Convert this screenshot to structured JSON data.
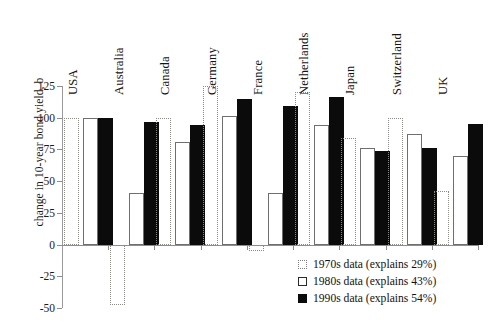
{
  "chart_data": {
    "type": "bar",
    "title": "",
    "xlabel": "",
    "ylabel": "change in 10-year bond yield, b",
    "ylim": [
      -50,
      125
    ],
    "yticks": [
      125,
      100,
      75,
      50,
      25,
      0,
      -25,
      -50
    ],
    "ytick_labels": [
      "125",
      "100",
      "75",
      "50",
      "25",
      "0",
      "-25",
      "-50"
    ],
    "grid": false,
    "legend_position": "bottom-right",
    "categories": [
      "USA",
      "Australia",
      "Canada",
      "Germany",
      "France",
      "Netherlands",
      "Japan",
      "Switzerland",
      "UK"
    ],
    "series": [
      {
        "name": "1970s data (explains 29%)",
        "short_name": "1970s data",
        "explains": "29%",
        "style": "dotted-outline",
        "values": [
          100,
          -48,
          100,
          125,
          -5,
          120,
          84,
          100,
          42
        ]
      },
      {
        "name": "1980s data (explains 43%)",
        "short_name": "1980s data",
        "explains": "43%",
        "style": "white-fill",
        "values": [
          100,
          41,
          81,
          101,
          41,
          94,
          76,
          87,
          70
        ]
      },
      {
        "name": "1990s data (explains 54%)",
        "short_name": "1990s data",
        "explains": "54%",
        "style": "black-fill",
        "values": [
          100,
          97,
          94,
          115,
          109,
          116,
          74,
          76,
          95
        ]
      }
    ]
  },
  "legend": {
    "items": [
      {
        "label": "1970s data (explains 29%)"
      },
      {
        "label": "1980s data (explains 43%)"
      },
      {
        "label": "1990s data (explains 54%)"
      }
    ]
  }
}
